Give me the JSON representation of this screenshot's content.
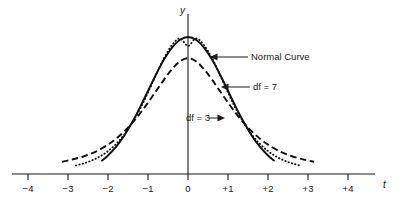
{
  "chart_data": {
    "type": "line",
    "title": "",
    "xlabel": "t",
    "ylabel": "y",
    "xlim": [
      -4.6,
      4.9
    ],
    "ylim": [
      0,
      1.12
    ],
    "grid": false,
    "legend_position": "inline-annotations",
    "x_tick_labels": [
      "−4",
      "−3",
      "−2",
      "−1",
      "0",
      "+1",
      "+2",
      "+3",
      "+4"
    ],
    "x_tick_values": [
      -4,
      -3,
      -2,
      -1,
      0,
      1,
      2,
      3,
      4
    ],
    "y_tick_labels": [],
    "series": [
      {
        "name": "Normal Curve",
        "style": "solid",
        "peak_value": 1.0,
        "x_range": [
          -2.15,
          2.15
        ],
        "x": [
          -2.15,
          -2.0,
          -1.8,
          -1.6,
          -1.4,
          -1.2,
          -1.0,
          -0.8,
          -0.6,
          -0.4,
          -0.2,
          0.0,
          0.2,
          0.4,
          0.6,
          0.8,
          1.0,
          1.2,
          1.4,
          1.6,
          1.8,
          2.0,
          2.15
        ],
        "values": [
          0.0975,
          0.1353,
          0.1979,
          0.278,
          0.3753,
          0.4868,
          0.6065,
          0.7261,
          0.8353,
          0.9231,
          0.9802,
          1.0,
          0.9802,
          0.9231,
          0.8353,
          0.7261,
          0.6065,
          0.4868,
          0.3753,
          0.278,
          0.1979,
          0.1353,
          0.0975
        ]
      },
      {
        "name": "df = 7",
        "style": "dotted",
        "peak_value": 0.935,
        "x_range": [
          -2.8,
          2.8
        ],
        "x": [
          -2.8,
          -2.6,
          -2.4,
          -2.2,
          -2.0,
          -1.8,
          -1.6,
          -1.4,
          -1.2,
          -1.0,
          -0.8,
          -0.6,
          -0.4,
          -0.2,
          0.0,
          0.2,
          0.4,
          0.6,
          0.8,
          1.0,
          1.2,
          1.4,
          1.6,
          1.8,
          2.0,
          2.2,
          2.4,
          2.6,
          2.8
        ],
        "values": [
          0.062,
          0.078,
          0.0995,
          0.1285,
          0.1672,
          0.2185,
          0.2855,
          0.3707,
          0.4749,
          0.5952,
          0.7235,
          0.8452,
          0.941,
          0.989,
          0.935,
          0.989,
          0.941,
          0.8452,
          0.7235,
          0.5952,
          0.4749,
          0.3707,
          0.2855,
          0.2185,
          0.1672,
          0.1285,
          0.0995,
          0.078,
          0.062
        ]
      },
      {
        "name": "df = 3",
        "style": "dashed",
        "peak_value": 0.845,
        "x_range": [
          -3.15,
          3.15
        ],
        "x": [
          -3.15,
          -2.9,
          -2.6,
          -2.3,
          -2.0,
          -1.8,
          -1.6,
          -1.4,
          -1.2,
          -1.0,
          -0.8,
          -0.6,
          -0.4,
          -0.2,
          0.0,
          0.2,
          0.4,
          0.6,
          0.8,
          1.0,
          1.2,
          1.4,
          1.6,
          1.8,
          2.0,
          2.3,
          2.6,
          2.9,
          3.15
        ],
        "values": [
          0.0895,
          0.1055,
          0.1295,
          0.164,
          0.2145,
          0.2575,
          0.3095,
          0.371,
          0.442,
          0.521,
          0.605,
          0.689,
          0.765,
          0.823,
          0.845,
          0.823,
          0.765,
          0.689,
          0.605,
          0.521,
          0.442,
          0.371,
          0.3095,
          0.2575,
          0.2145,
          0.164,
          0.1295,
          0.1055,
          0.0895
        ]
      }
    ],
    "annotations": [
      {
        "key": "normal_curve",
        "label": "Normal Curve",
        "arrow_direction": "left",
        "points_to_series": "Normal Curve"
      },
      {
        "key": "df7",
        "label": "df = 7",
        "arrow_direction": "left",
        "points_to_series": "df = 7"
      },
      {
        "key": "df3",
        "label": "df = 3",
        "arrow_direction": "right",
        "points_to_series": "df = 3"
      }
    ],
    "axis_name_y": "y",
    "axis_name_t": "t"
  },
  "colors": {
    "ink": "#1a1a1a",
    "curve": "#111111",
    "background": "#ffffff"
  }
}
